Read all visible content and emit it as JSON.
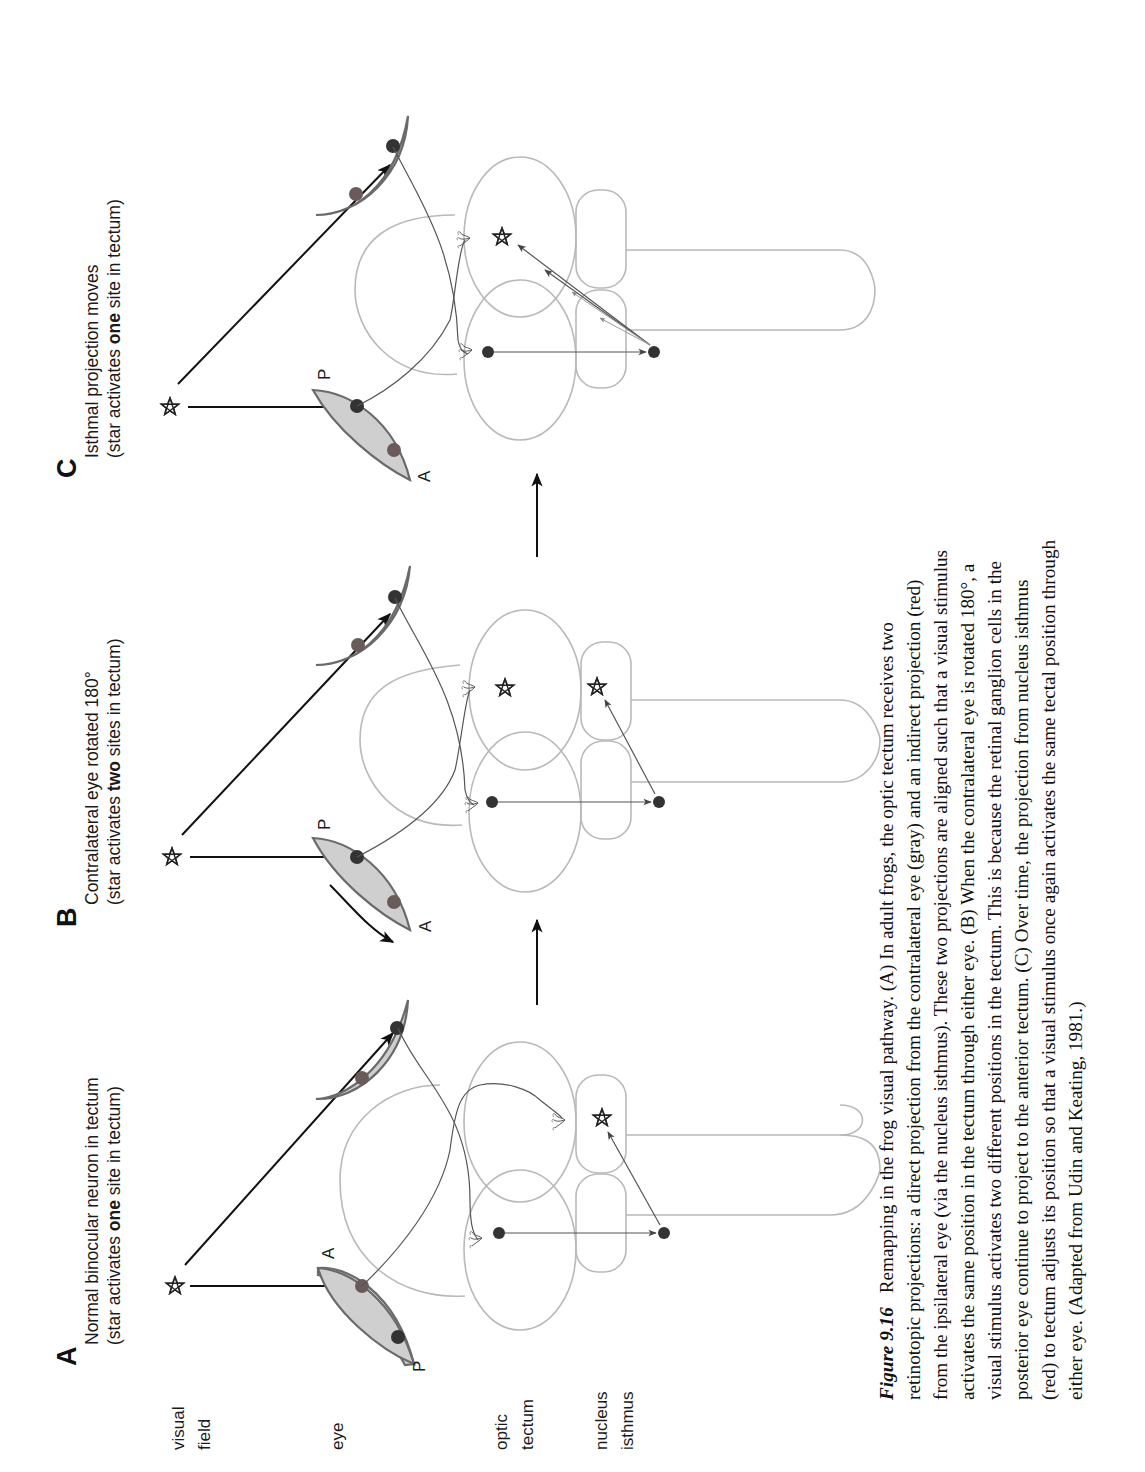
{
  "figure": {
    "row_labels": [
      {
        "line1": "visual",
        "line2": "field"
      },
      {
        "line1": "eye",
        "line2": ""
      },
      {
        "line1": "optic",
        "line2": "tectum"
      },
      {
        "line1": "nucleus",
        "line2": "isthmus"
      }
    ],
    "panels": [
      {
        "letter": "A",
        "title_line1": "Normal binocular neuron in tectum",
        "title_line2_pre": "(star activates ",
        "title_line2_bold": "one",
        "title_line2_post": " site in tectum)",
        "ipsi_eye_labels": {
          "top": "A",
          "bottom": "P"
        },
        "tectal_sites": 1
      },
      {
        "letter": "B",
        "title_line1": "Contralateral eye rotated 180°",
        "title_line2_pre": "(star activates ",
        "title_line2_bold": "two",
        "title_line2_post": " sites in tectum)",
        "ipsi_eye_labels": {
          "top": "P",
          "bottom": "A"
        },
        "tectal_sites": 2
      },
      {
        "letter": "C",
        "title_line1": "Isthmal projection moves",
        "title_line2_pre": "(star activates ",
        "title_line2_bold": "one",
        "title_line2_post": " site in tectum)",
        "ipsi_eye_labels": {
          "top": "P",
          "bottom": "A"
        },
        "tectal_sites": 1
      }
    ],
    "colors": {
      "eye_fill": "#cfcfcf",
      "eye_stroke": "#6a6a6a",
      "direct_cell": "#333333",
      "indirect_cell": "#6b5a5a",
      "brain_outline": "#b9b9b9"
    }
  },
  "caption": {
    "figure_label": "Figure 9.16",
    "lines": [
      "Remapping in the frog visual pathway. (A) In adult frogs, the optic tectum receives two",
      "retinotopic projections: a direct projection from the contralateral eye (gray) and an indirect projection (red)",
      "from the ipsilateral eye (via the nucleus isthmus). These two projections are aligned such that a visual stimulus",
      "activates the same position in the tectum through either eye. (B) When the contralateral eye is rotated 180°, a",
      "visual stimulus activates two different positions in the tectum. This is because the retinal ganglion cells in the",
      "posterior eye continue to project to the anterior tectum. (C) Over time, the projection from nucleus isthmus",
      "(red) to tectum adjusts its position so that a visual stimulus once again activates the same tectal position through",
      "either eye. (Adapted from Udin and Keating, 1981.)"
    ]
  }
}
